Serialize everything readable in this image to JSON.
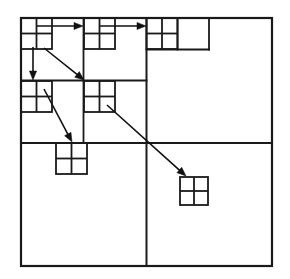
{
  "figure": {
    "name": "quadtree-z-order-traversal",
    "title": "Quadtree subdivision with Z-order traversal arrows",
    "background_color": "#ffffff",
    "stroke_color": "#1a1a1a",
    "arrow_color": "#111111"
  },
  "canvas": {
    "width": 290,
    "height": 279
  },
  "outer_square": {
    "label": "outer-square",
    "x": 21,
    "y": 18,
    "width": 251,
    "height": 248,
    "stroke_width": 2.2
  },
  "divider_lines": [
    {
      "label": "root-vertical-split",
      "x1": 146.5,
      "y1": 18,
      "x2": 146.5,
      "y2": 266,
      "stroke_width": 2.0
    },
    {
      "label": "root-horizontal-split",
      "x1": 21,
      "y1": 143,
      "x2": 272,
      "y2": 143,
      "stroke_width": 2.0
    },
    {
      "label": "nw-quadrant-vertical-split",
      "x1": 83.5,
      "y1": 18,
      "x2": 83.5,
      "y2": 143,
      "stroke_width": 1.8
    },
    {
      "label": "nw-quadrant-horizontal-split",
      "x1": 21,
      "y1": 80.5,
      "x2": 146.5,
      "y2": 80.5,
      "stroke_width": 1.8
    },
    {
      "label": "ne-sub-vertical-split",
      "x1": 177.5,
      "y1": 18,
      "x2": 177.5,
      "y2": 49.5,
      "stroke_width": 1.8
    },
    {
      "label": "ne-sub-horizontal-split",
      "x1": 146.5,
      "y1": 49.5,
      "x2": 209,
      "y2": 49.5,
      "stroke_width": 1.8
    },
    {
      "label": "ne-sub-right-edge",
      "x1": 209,
      "y1": 18,
      "x2": 209,
      "y2": 49.5,
      "stroke_width": 1.8
    }
  ],
  "leaf_blocks": [
    {
      "label": "leaf-block-1-nw-nw",
      "order": 1,
      "x": 21,
      "y": 18,
      "size": 31,
      "divisions": 2,
      "stroke_width": 1.8
    },
    {
      "label": "leaf-block-2-nw-ne",
      "order": 2,
      "x": 84,
      "y": 18,
      "size": 31,
      "divisions": 2,
      "stroke_width": 1.8
    },
    {
      "label": "leaf-block-3-ne-nw",
      "order": 3,
      "x": 146.5,
      "y": 18,
      "size": 31,
      "divisions": 2,
      "stroke_width": 1.8
    },
    {
      "label": "leaf-block-4-nw-sw",
      "order": 4,
      "x": 21,
      "y": 81,
      "size": 31,
      "divisions": 2,
      "stroke_width": 1.8
    },
    {
      "label": "leaf-block-5-nw-se",
      "order": 5,
      "x": 84,
      "y": 81,
      "size": 31,
      "divisions": 2,
      "stroke_width": 1.8
    },
    {
      "label": "leaf-block-6-sw-nw",
      "order": 6,
      "x": 56,
      "y": 143,
      "size": 31,
      "divisions": 2,
      "stroke_width": 1.8
    },
    {
      "label": "leaf-block-7-se-nw",
      "order": 7,
      "x": 180,
      "y": 177,
      "size": 28,
      "divisions": 2,
      "stroke_width": 1.8
    }
  ],
  "arrows": [
    {
      "label": "arrow-1-horizontal-right",
      "kind": "horizontal",
      "from": {
        "x": 37,
        "y": 26
      },
      "to": {
        "x": 83,
        "y": 26
      },
      "stroke_width": 1.6
    },
    {
      "label": "arrow-2-horizontal-right",
      "kind": "horizontal",
      "from": {
        "x": 100,
        "y": 26
      },
      "to": {
        "x": 146,
        "y": 26
      },
      "stroke_width": 1.6
    },
    {
      "label": "arrow-3-vertical-down",
      "kind": "vertical",
      "from": {
        "x": 33,
        "y": 47
      },
      "to": {
        "x": 33,
        "y": 80
      },
      "stroke_width": 1.6
    },
    {
      "label": "arrow-4-diagonal-down-right",
      "kind": "diagonal",
      "from": {
        "x": 44,
        "y": 48
      },
      "to": {
        "x": 84,
        "y": 80
      },
      "stroke_width": 1.6
    },
    {
      "label": "arrow-5-diagonal-down-right",
      "kind": "diagonal",
      "from": {
        "x": 44,
        "y": 89
      },
      "to": {
        "x": 72,
        "y": 142
      },
      "stroke_width": 1.6
    },
    {
      "label": "arrow-6-diagonal-down-right-long",
      "kind": "diagonal",
      "from": {
        "x": 107,
        "y": 105
      },
      "to": {
        "x": 186,
        "y": 176
      },
      "stroke_width": 1.6
    }
  ],
  "arrowhead": {
    "label": "arrowhead-marker",
    "length": 9,
    "half_width": 3.6
  }
}
